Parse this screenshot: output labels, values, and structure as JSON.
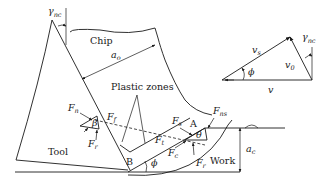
{
  "figure": {
    "labels": {
      "chip": "Chip",
      "tool": "Tool",
      "work": "Work",
      "plastic_zones": "Plastic zones",
      "point_a": "A",
      "point_b": "B",
      "chip_thickness": "a",
      "chip_thickness_sub": "o",
      "cut_thickness": "a",
      "cut_thickness_sub": "c",
      "rake_angle": "γ",
      "rake_angle_sub": "nc",
      "shear_angle": "ϕ",
      "friction_angle": "β",
      "theta": "θ"
    },
    "forces_tool_side": [
      {
        "name": "F",
        "sub": "n"
      },
      {
        "name": "F",
        "sub": "f"
      },
      {
        "name": "F",
        "sub": "r"
      }
    ],
    "forces_work_side": [
      {
        "name": "F",
        "sub": "s"
      },
      {
        "name": "F",
        "sub": "ns"
      },
      {
        "name": "F",
        "sub": "t"
      },
      {
        "name": "F",
        "sub": "c"
      },
      {
        "name": "F",
        "sub": "r"
      }
    ],
    "velocity_triangle": {
      "shear_velocity": "v",
      "shear_velocity_sub": "s",
      "chip_velocity": "v",
      "chip_velocity_sub": "0",
      "cutting_velocity": "v",
      "shear_angle": "ϕ",
      "rake_angle": "γ",
      "rake_angle_sub": "nc"
    },
    "colors": {
      "line": "#1a1a1a",
      "background": "#ffffff"
    }
  }
}
